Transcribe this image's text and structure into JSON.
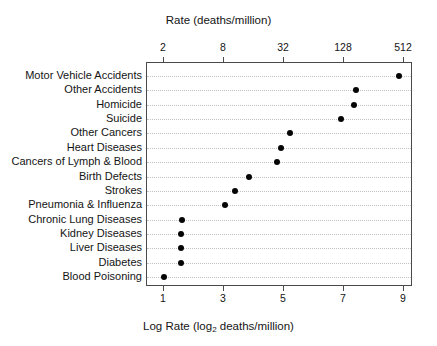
{
  "chart_data": {
    "type": "scatter",
    "subtype": "cleveland-dot-plot",
    "title": "",
    "xlabel": "Log Rate (log2 deaths/million)",
    "ylabel": "",
    "top_axis_label": "Rate (deaths/million)",
    "bottom_axis_label_parts": {
      "prefix": "Log Rate (log",
      "subscript": "2",
      "suffix": " deaths/million)"
    },
    "grid": true,
    "grid_orientation": "horizontal",
    "legend": "none",
    "xlim": [
      0.5,
      9.5
    ],
    "top_axis_ticks": [
      "2",
      "8",
      "32",
      "128",
      "512"
    ],
    "top_axis_tick_values": [
      1,
      3,
      5,
      7,
      9
    ],
    "bottom_axis_ticks": [
      "1",
      "3",
      "5",
      "7",
      "9"
    ],
    "bottom_axis_tick_values": [
      1,
      3,
      5,
      7,
      9
    ],
    "marker_color": "#050505",
    "grid_color": "#c2c2c2",
    "frame_color": "#4a4a4a",
    "categories": [
      "Motor Vehicle Accidents",
      "Other Accidents",
      "Homicide",
      "Suicide",
      "Other Cancers",
      "Heart Diseases",
      "Cancers of Lymph & Blood",
      "Birth Defects",
      "Strokes",
      "Pneumonia & Influenza",
      "Chronic Lung Diseases",
      "Kidney Diseases",
      "Liver Diseases",
      "Diabetes",
      "Blood Poisoning"
    ],
    "values": [
      8.83,
      7.4,
      7.33,
      6.9,
      5.2,
      4.9,
      4.77,
      3.83,
      3.37,
      3.03,
      1.6,
      1.58,
      1.57,
      1.57,
      1.0
    ],
    "values_rate_deaths_per_million": [
      455,
      169,
      161,
      119,
      37,
      30,
      27,
      14,
      10,
      8,
      3,
      3,
      3,
      3,
      2
    ]
  }
}
